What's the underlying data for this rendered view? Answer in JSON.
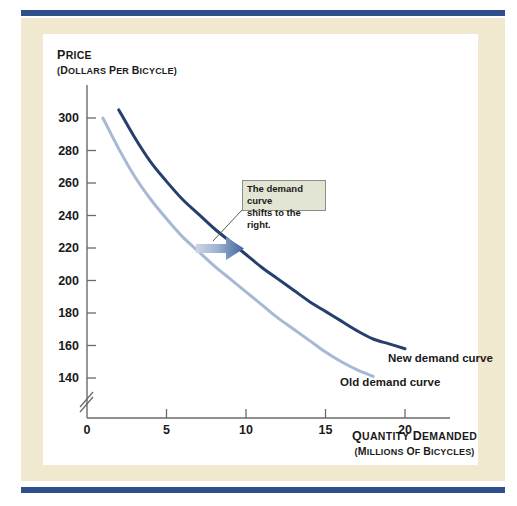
{
  "figure": {
    "background_color": "#ffffff",
    "panel_color": "#f0e8cf",
    "card_color": "#ffffff",
    "rule_color": "#2d4f8b"
  },
  "axes": {
    "y_title_main": "PRICE",
    "y_title_sub": "(DOLLARS PER BICYCLE)",
    "x_title_main": "QUANTITY DEMANDED",
    "x_title_sub": "(MILLIONS OF BICYCLES)",
    "y_ticks": [
      "140",
      "160",
      "180",
      "200",
      "220",
      "240",
      "260",
      "280",
      "300"
    ],
    "x_ticks": [
      "0",
      "5",
      "10",
      "15",
      "20"
    ],
    "axis_break": true
  },
  "annotations": {
    "callout_line1": "The demand curve",
    "callout_line2": "shifts to the right.",
    "callout_fill": "#e2e5d4",
    "callout_border": "#8d8f82",
    "new_curve_label": "New demand curve",
    "old_curve_label": "Old demand curve",
    "arrow_color_light": "#b8c6dd",
    "arrow_color_dark": "#41639d"
  },
  "chart_data": {
    "type": "line",
    "title": "",
    "subtitle": "",
    "xlabel": "Quantity demanded (millions of bicycles)",
    "ylabel": "Price (dollars per bicycle)",
    "xlim": [
      0,
      22
    ],
    "ylim": [
      130,
      312
    ],
    "grid": false,
    "legend": "inline labels at curve ends",
    "y_tick_values": [
      140,
      160,
      180,
      200,
      220,
      240,
      260,
      280,
      300
    ],
    "x_tick_values": [
      0,
      5,
      10,
      15,
      20
    ],
    "series": [
      {
        "name": "Old demand curve",
        "color": "#a8b8d4",
        "points": [
          {
            "x": 1.0,
            "y": 300
          },
          {
            "x": 2.0,
            "y": 281
          },
          {
            "x": 3.0,
            "y": 264
          },
          {
            "x": 4.0,
            "y": 250
          },
          {
            "x": 5.0,
            "y": 238
          },
          {
            "x": 6.0,
            "y": 227
          },
          {
            "x": 7.0,
            "y": 218
          },
          {
            "x": 8.0,
            "y": 209
          },
          {
            "x": 9.0,
            "y": 201
          },
          {
            "x": 10.0,
            "y": 193
          },
          {
            "x": 11.0,
            "y": 185
          },
          {
            "x": 12.0,
            "y": 177
          },
          {
            "x": 13.0,
            "y": 170
          },
          {
            "x": 14.0,
            "y": 163
          },
          {
            "x": 15.0,
            "y": 156
          },
          {
            "x": 16.0,
            "y": 150
          },
          {
            "x": 17.0,
            "y": 145
          },
          {
            "x": 18.0,
            "y": 141
          }
        ]
      },
      {
        "name": "New demand curve",
        "color": "#26406e",
        "points": [
          {
            "x": 2.0,
            "y": 305
          },
          {
            "x": 3.0,
            "y": 288
          },
          {
            "x": 4.0,
            "y": 273
          },
          {
            "x": 5.0,
            "y": 261
          },
          {
            "x": 6.0,
            "y": 250
          },
          {
            "x": 7.0,
            "y": 241
          },
          {
            "x": 8.0,
            "y": 232
          },
          {
            "x": 9.0,
            "y": 224
          },
          {
            "x": 10.0,
            "y": 216
          },
          {
            "x": 11.0,
            "y": 208
          },
          {
            "x": 12.0,
            "y": 201
          },
          {
            "x": 13.0,
            "y": 194
          },
          {
            "x": 14.0,
            "y": 187
          },
          {
            "x": 15.0,
            "y": 181
          },
          {
            "x": 16.0,
            "y": 175
          },
          {
            "x": 17.0,
            "y": 169
          },
          {
            "x": 18.0,
            "y": 164
          },
          {
            "x": 19.0,
            "y": 161
          },
          {
            "x": 20.0,
            "y": 158
          }
        ]
      }
    ],
    "annotations": [
      {
        "text": "The demand curve shifts to the right.",
        "type": "callout-box"
      },
      {
        "text": "shift arrow",
        "type": "arrow",
        "from": {
          "x": 7.0,
          "y": 220
        },
        "to": {
          "x": 9.9,
          "y": 220
        }
      }
    ]
  }
}
